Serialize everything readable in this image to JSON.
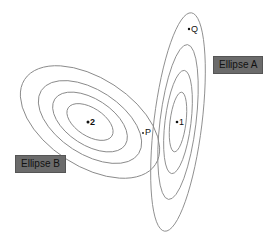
{
  "diagram": {
    "colors": {
      "contour": "#8a8a8a",
      "label_bg": "#6b6b6b",
      "text": "#111111",
      "background": "#ffffff"
    },
    "ellipses": [
      {
        "id": "A",
        "label": "Ellipse A",
        "center_label": "1",
        "center": [
          178,
          122
        ],
        "rotation_deg": -83,
        "contours": [
          {
            "rx": 110,
            "ry": 24
          },
          {
            "rx": 78,
            "ry": 18
          },
          {
            "rx": 52,
            "ry": 13
          },
          {
            "rx": 30,
            "ry": 8
          }
        ]
      },
      {
        "id": "B",
        "label": "Ellipse B",
        "center_label": "2",
        "center": [
          90,
          122
        ],
        "rotation_deg": 33,
        "contours": [
          {
            "rx": 78,
            "ry": 44
          },
          {
            "rx": 58,
            "ry": 32
          },
          {
            "rx": 42,
            "ry": 23
          },
          {
            "rx": 26,
            "ry": 14
          }
        ]
      }
    ],
    "points": [
      {
        "name": "P",
        "label": "P",
        "x": 143,
        "y": 133
      },
      {
        "name": "Q",
        "label": "Q",
        "x": 190,
        "y": 28
      }
    ]
  }
}
